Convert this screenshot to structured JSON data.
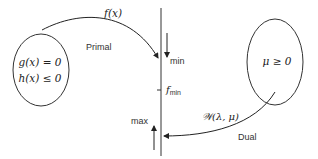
{
  "diagram": {
    "primal_set": {
      "constraint_1": "g(x) = 0",
      "constraint_2": "h(x) ≤ 0"
    },
    "dual_set": {
      "constraint": "μ ≥ 0"
    },
    "primal_arrow": {
      "function_label": "f(x)",
      "label": "Primal"
    },
    "dual_arrow": {
      "function_label": "𝒲(λ, μ)",
      "label": "Dual"
    },
    "axis": {
      "min_label": "min",
      "max_label": "max",
      "fmin_label": "f",
      "fmin_subscript": "min"
    }
  }
}
